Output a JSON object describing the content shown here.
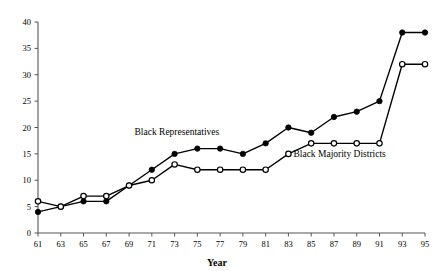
{
  "chart_data": {
    "type": "line",
    "title": "",
    "subtitle": "",
    "xlabel": "Year",
    "ylabel": "",
    "x": [
      61,
      63,
      65,
      67,
      69,
      71,
      73,
      75,
      77,
      79,
      81,
      83,
      85,
      87,
      89,
      91,
      93,
      95
    ],
    "xtick_labels": [
      "61",
      "63",
      "65",
      "67",
      "69",
      "71",
      "73",
      "75",
      "77",
      "79",
      "81",
      "83",
      "85",
      "87",
      "89",
      "91",
      "93",
      "95"
    ],
    "ytick_labels": [
      "0",
      "5",
      "10",
      "15",
      "20",
      "25",
      "30",
      "35",
      "40"
    ],
    "ytick_values": [
      0,
      5,
      10,
      15,
      20,
      25,
      30,
      35,
      40
    ],
    "xlim": [
      61,
      95
    ],
    "ylim": [
      0,
      40
    ],
    "grid": false,
    "legend_position": "inline-annotations",
    "series": [
      {
        "name": "Black Representatives",
        "marker": "filled-circle",
        "color": "#000000",
        "values": [
          4,
          5,
          6,
          6,
          9,
          12,
          15,
          16,
          16,
          15,
          17,
          20,
          19,
          22,
          23,
          25,
          38,
          38
        ]
      },
      {
        "name": "Black Majority Districts",
        "marker": "open-circle",
        "color": "#000000",
        "values": [
          6,
          5,
          7,
          7,
          9,
          10,
          13,
          12,
          12,
          12,
          12,
          15,
          17,
          17,
          17,
          17,
          32,
          32
        ]
      }
    ],
    "annotations": [
      {
        "text": "Black Representatives",
        "x": 73.2,
        "y": 18.6,
        "anchor": "middle"
      },
      {
        "text": "Black Majority Districts",
        "x": 87.5,
        "y": 14.5,
        "anchor": "middle"
      }
    ]
  }
}
